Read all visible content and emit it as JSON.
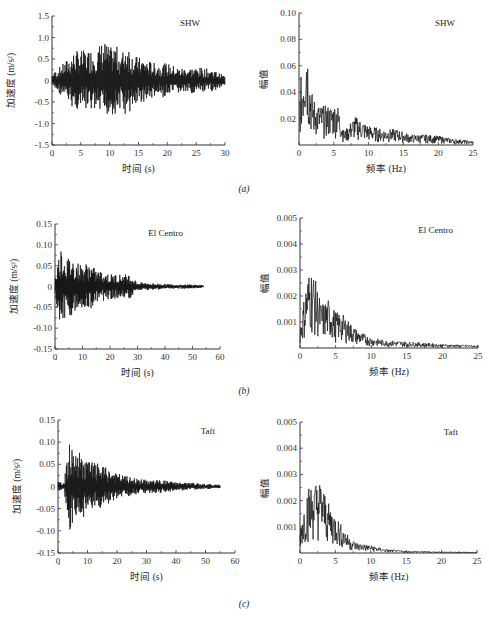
{
  "figure": {
    "captions": [
      "(a)",
      "(b)",
      "(c)"
    ]
  },
  "chart_data": [
    {
      "id": "a-time",
      "type": "line",
      "panel": "(a)",
      "annotation": "SHW",
      "title": "",
      "xlabel": "时间 (s)",
      "ylabel": "加速度 (m/s²)",
      "xlim": [
        0,
        30
      ],
      "ylim": [
        -1.5,
        1.5
      ],
      "xticks": [
        "0",
        "5",
        "10",
        "15",
        "20",
        "25",
        "30"
      ],
      "yticks": [
        "1.5",
        "1.0",
        "0.5",
        "0",
        "-0.5",
        "-1.0",
        "-1.5"
      ],
      "envelope": {
        "x": [
          0,
          2,
          4,
          6,
          8,
          9,
          10,
          11,
          12,
          13,
          14,
          16,
          18,
          20,
          22,
          24,
          26,
          28,
          30
        ],
        "peak": [
          0.15,
          0.4,
          0.7,
          0.7,
          0.8,
          0.95,
          0.75,
          0.85,
          0.6,
          0.95,
          0.6,
          0.5,
          0.4,
          0.4,
          0.3,
          0.3,
          0.3,
          0.25,
          0.1
        ]
      },
      "grid": false,
      "legend": "none"
    },
    {
      "id": "a-freq",
      "type": "line",
      "panel": "(a)",
      "annotation": "SHW",
      "xlabel": "频率 (Hz)",
      "ylabel": "幅值",
      "xlim": [
        0,
        25
      ],
      "ylim": [
        0,
        0.1
      ],
      "xticks": [
        "0",
        "5",
        "10",
        "15",
        "20",
        "25"
      ],
      "yticks": [
        "0.10",
        "0.08",
        "0.06",
        "0.04",
        "0.02"
      ],
      "envelope": {
        "x": [
          0,
          0.5,
          1,
          1.5,
          2,
          3,
          4.5,
          5.5,
          6.5,
          8,
          10,
          12,
          14,
          16,
          18,
          20,
          22,
          25
        ],
        "peak": [
          0.04,
          0.06,
          0.093,
          0.055,
          0.036,
          0.03,
          0.03,
          0.032,
          0.01,
          0.022,
          0.015,
          0.012,
          0.012,
          0.008,
          0.008,
          0.007,
          0.005,
          0.003
        ]
      },
      "grid": false,
      "legend": "none"
    },
    {
      "id": "b-time",
      "type": "line",
      "panel": "(b)",
      "annotation": "El Centro",
      "xlabel": "时间 (s)",
      "ylabel": "加速度 (m/s²)",
      "xlim": [
        0,
        60
      ],
      "ylim": [
        -0.15,
        0.15
      ],
      "xticks": [
        "0",
        "10",
        "20",
        "30",
        "40",
        "50",
        "60"
      ],
      "yticks": [
        "0.15",
        "0.10",
        "0.05",
        "0",
        "-0.05",
        "-0.10",
        "-0.15"
      ],
      "envelope": {
        "x": [
          0,
          2,
          4,
          6,
          10,
          12,
          15,
          20,
          25,
          27,
          30,
          35,
          40,
          45,
          50,
          54
        ],
        "peak": [
          0.02,
          0.1,
          0.07,
          0.07,
          0.05,
          0.06,
          0.04,
          0.03,
          0.03,
          0.03,
          0.01,
          0.008,
          0.006,
          0.005,
          0.005,
          0.003
        ]
      },
      "grid": false,
      "legend": "none"
    },
    {
      "id": "b-freq",
      "type": "line",
      "panel": "(b)",
      "annotation": "El Centro",
      "xlabel": "频率 (Hz)",
      "ylabel": "幅值",
      "xlim": [
        0,
        25
      ],
      "ylim": [
        0,
        0.005
      ],
      "xticks": [
        "0",
        "5",
        "10",
        "15",
        "20",
        "25"
      ],
      "yticks": [
        "0.005",
        "0.004",
        "0.003",
        "0.002",
        "0.001"
      ],
      "envelope": {
        "x": [
          0,
          1,
          1.5,
          2,
          3,
          4,
          5,
          6,
          8,
          10,
          12,
          15,
          20,
          25
        ],
        "peak": [
          0.0008,
          0.0028,
          0.0031,
          0.0028,
          0.0017,
          0.0019,
          0.0014,
          0.0013,
          0.0007,
          0.0004,
          0.0003,
          0.00025,
          0.00015,
          0.0001
        ]
      },
      "grid": false,
      "legend": "none"
    },
    {
      "id": "c-time",
      "type": "line",
      "panel": "(c)",
      "annotation": "Taft",
      "xlabel": "时间 (s)",
      "ylabel": "加速度 (m/s²)",
      "xlim": [
        0,
        60
      ],
      "ylim": [
        -0.15,
        0.15
      ],
      "xticks": [
        "0",
        "10",
        "20",
        "30",
        "40",
        "50",
        "60"
      ],
      "yticks": [
        "0.15",
        "0.10",
        "0.05",
        "0",
        "-0.05",
        "-0.10",
        "-0.15"
      ],
      "envelope": {
        "x": [
          0,
          2,
          4,
          6,
          7,
          10,
          14,
          20,
          25,
          30,
          35,
          40,
          45,
          50,
          55
        ],
        "peak": [
          0.01,
          0.01,
          0.1,
          0.07,
          0.08,
          0.06,
          0.05,
          0.03,
          0.02,
          0.015,
          0.015,
          0.01,
          0.008,
          0.006,
          0.004
        ]
      },
      "grid": false,
      "legend": "none"
    },
    {
      "id": "c-freq",
      "type": "line",
      "panel": "(c)",
      "annotation": "Taft",
      "xlabel": "频率 (Hz)",
      "ylabel": "幅值",
      "xlim": [
        0,
        25
      ],
      "ylim": [
        0,
        0.005
      ],
      "xticks": [
        "0",
        "5",
        "10",
        "15",
        "20",
        "25"
      ],
      "yticks": [
        "0.005",
        "0.004",
        "0.003",
        "0.002",
        "0.001"
      ],
      "envelope": {
        "x": [
          0,
          1,
          2,
          2.5,
          3,
          4,
          5,
          6,
          7,
          8,
          10,
          12,
          15,
          20,
          25
        ],
        "peak": [
          0.001,
          0.0025,
          0.0027,
          0.0028,
          0.0028,
          0.0019,
          0.0015,
          0.001,
          0.0006,
          0.0004,
          0.0003,
          0.00015,
          8e-05,
          5e-05,
          3e-05
        ]
      },
      "grid": false,
      "legend": "none"
    }
  ]
}
